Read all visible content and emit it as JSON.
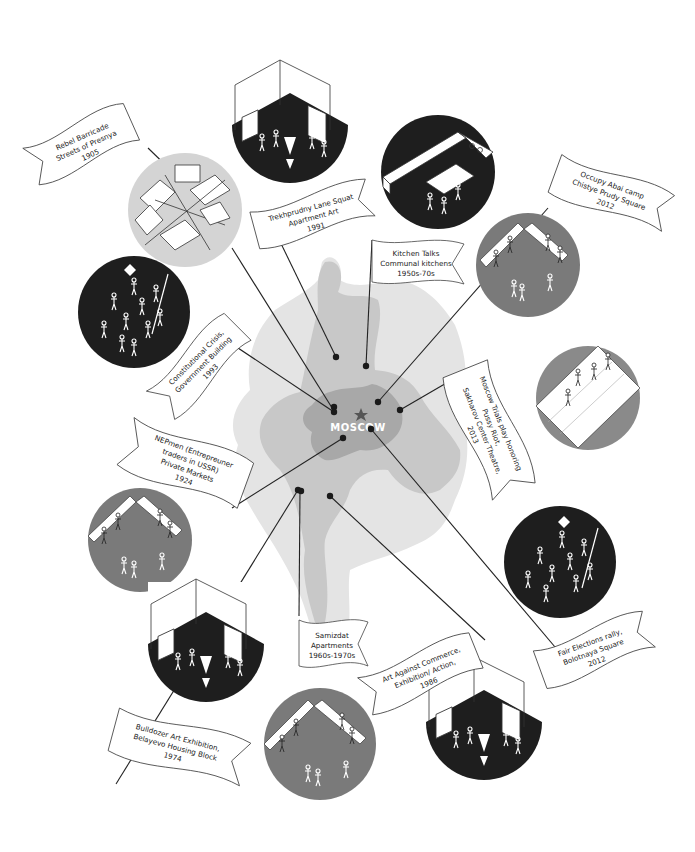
{
  "map": {
    "city_label": "MOSCOW",
    "center_icon": "star-icon",
    "colors": {
      "outer_region": "#e2e2e2",
      "middle_region": "#c9c9c9",
      "center_region": "#a9a9a9",
      "star": "#555555"
    }
  },
  "events": [
    {
      "id": "rebel-barricade",
      "lines": [
        "Rebel Barricade",
        "Streets of Presnya",
        "1905"
      ],
      "year": "1905",
      "circle_color": "#d4d4d4",
      "scene": "barricade"
    },
    {
      "id": "trekhprudny",
      "lines": [
        "Trekhprudny Lane Squat",
        "Apartment Art",
        "1991"
      ],
      "year": "1991",
      "circle_color": "#1e1e1e",
      "scene": "apartment-room"
    },
    {
      "id": "kitchen-talks",
      "lines": [
        "Kitchen Talks",
        "Communal kitchens",
        "1950s-70s"
      ],
      "year": "1950s-70s",
      "circle_color": "#1e1e1e",
      "scene": "kitchen"
    },
    {
      "id": "occupy-abai",
      "lines": [
        "Occupy Abai camp",
        "Chistye Prudy Square",
        "2012"
      ],
      "year": "2012",
      "circle_color": "#7a7a7a",
      "scene": "camp-benches"
    },
    {
      "id": "constitutional-crisis",
      "lines": [
        "Constitutional Crisis,",
        "Government Building",
        "1993"
      ],
      "year": "1993",
      "circle_color": "#1e1e1e",
      "scene": "crowd"
    },
    {
      "id": "moscow-trials",
      "lines": [
        "Moscow Trials play honoring",
        "Pussy Riot,",
        "Sakharov Center Theatre,",
        "2013"
      ],
      "year": "2013",
      "circle_color": "#8a8a8a",
      "scene": "stage"
    },
    {
      "id": "nepmen",
      "lines": [
        "NEPmen (Entrepreuner",
        "traders in USSR)",
        "Private Markets",
        "1924"
      ],
      "year": "1924",
      "circle_color": "#7a7a7a",
      "scene": "market-benches"
    },
    {
      "id": "fair-elections",
      "lines": [
        "Fair Elections rally,",
        "Bolotnaya Square",
        "2012"
      ],
      "year": "2012",
      "circle_color": "#1e1e1e",
      "scene": "crowd"
    },
    {
      "id": "samizdat",
      "lines": [
        "Samizdat",
        "Apartments",
        "1960s-1970s"
      ],
      "year": "1960s-1970s",
      "circle_color": "#7a7a7a",
      "scene": "apartment-benches"
    },
    {
      "id": "art-against-commerce",
      "lines": [
        "Art Against Commerce,",
        "Exhibition/ Action,",
        "1986"
      ],
      "year": "1986",
      "circle_color": "#1e1e1e",
      "scene": "apartment-room"
    },
    {
      "id": "bulldozer",
      "lines": [
        "Bulldozer Art Exhibition,",
        "Belayevo Housing Block",
        "1974"
      ],
      "year": "1974",
      "circle_color": "#1e1e1e",
      "scene": "apartment-room"
    }
  ]
}
